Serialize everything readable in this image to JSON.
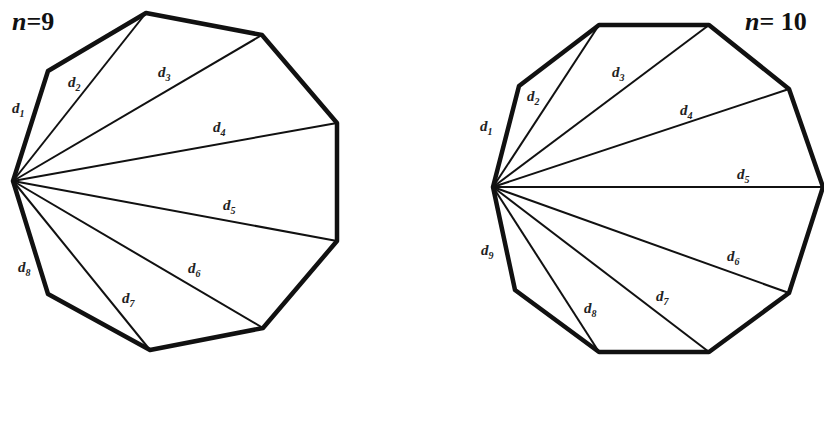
{
  "figures": [
    {
      "id": "nonagon",
      "title": "n=9",
      "title_pos": [
        12,
        30
      ],
      "n": 9,
      "vertices": [
        [
          13,
          181
        ],
        [
          48,
          71
        ],
        [
          146,
          13
        ],
        [
          262,
          35
        ],
        [
          337,
          123
        ],
        [
          337,
          241
        ],
        [
          263,
          328
        ],
        [
          150,
          350
        ],
        [
          48,
          294
        ]
      ],
      "diagonal_labels": [
        {
          "text": "d",
          "sub": "1",
          "x": 12,
          "y": 113
        },
        {
          "text": "d",
          "sub": "2",
          "x": 68,
          "y": 87
        },
        {
          "text": "d",
          "sub": "3",
          "x": 158,
          "y": 77
        },
        {
          "text": "d",
          "sub": "4",
          "x": 213,
          "y": 132
        },
        {
          "text": "d",
          "sub": "5",
          "x": 223,
          "y": 210
        },
        {
          "text": "d",
          "sub": "6",
          "x": 188,
          "y": 273
        },
        {
          "text": "d",
          "sub": "7",
          "x": 122,
          "y": 303
        },
        {
          "text": "d",
          "sub": "8",
          "x": 18,
          "y": 272
        }
      ]
    },
    {
      "id": "decagon",
      "title": "n= 10",
      "title_pos": [
        745,
        30
      ],
      "n": 10,
      "vertices": [
        [
          493,
          187
        ],
        [
          519,
          86
        ],
        [
          599,
          25
        ],
        [
          709,
          25
        ],
        [
          789,
          89
        ],
        [
          823,
          187
        ],
        [
          789,
          293
        ],
        [
          709,
          352
        ],
        [
          599,
          352
        ],
        [
          515,
          290
        ]
      ],
      "diagonal_labels": [
        {
          "text": "d",
          "sub": "1",
          "x": 480,
          "y": 131
        },
        {
          "text": "d",
          "sub": "2",
          "x": 527,
          "y": 101
        },
        {
          "text": "d",
          "sub": "3",
          "x": 612,
          "y": 77
        },
        {
          "text": "d",
          "sub": "4",
          "x": 680,
          "y": 115
        },
        {
          "text": "d",
          "sub": "5",
          "x": 737,
          "y": 179
        },
        {
          "text": "d",
          "sub": "6",
          "x": 727,
          "y": 261
        },
        {
          "text": "d",
          "sub": "7",
          "x": 656,
          "y": 301
        },
        {
          "text": "d",
          "sub": "8",
          "x": 584,
          "y": 313
        },
        {
          "text": "d",
          "sub": "9",
          "x": 481,
          "y": 255
        }
      ]
    }
  ]
}
